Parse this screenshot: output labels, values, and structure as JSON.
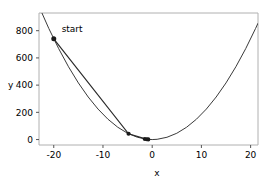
{
  "chart_data": {
    "type": "line",
    "title": "",
    "xlabel": "x",
    "ylabel": "y",
    "xlim": [
      -23.0,
      21.5
    ],
    "ylim": [
      -40,
      930
    ],
    "xticks": [
      -20,
      -10,
      0,
      10,
      20
    ],
    "xticklabels": [
      "-20",
      "-10",
      "0",
      "10",
      "20"
    ],
    "yticks": [
      0,
      200,
      400,
      600,
      800
    ],
    "yticklabels": [
      "0",
      "200",
      "400",
      "600",
      "800"
    ],
    "grid": false,
    "legend": null,
    "series": [
      {
        "name": "objective curve",
        "type": "line",
        "function": "y = 1.85 * x^2",
        "color": "#3a3a3a",
        "linewidth": 1.0,
        "x": [
          -23.0,
          -21.0,
          -19.0,
          -17.0,
          -15.0,
          -13.0,
          -11.0,
          -9.0,
          -7.0,
          -5.0,
          -3.0,
          -1.0,
          0.0,
          1.0,
          3.0,
          5.0,
          7.0,
          9.0,
          11.0,
          13.0,
          15.0,
          17.0,
          19.0,
          21.0,
          21.5
        ],
        "y": [
          978.6,
          815.9,
          667.9,
          534.7,
          416.3,
          312.7,
          223.9,
          149.9,
          90.7,
          46.3,
          16.7,
          1.9,
          0.0,
          1.9,
          16.7,
          46.3,
          90.7,
          149.9,
          223.9,
          312.7,
          416.3,
          534.7,
          667.9,
          815.9,
          855.2
        ]
      },
      {
        "name": "descent path",
        "type": "line",
        "color": "#2b2b2b",
        "linewidth": 1.2,
        "x": [
          -20.0,
          -4.8,
          -1.2,
          -0.9,
          -0.75
        ],
        "y": [
          740.0,
          42.6,
          2.7,
          1.5,
          1.0
        ]
      }
    ],
    "markers": [
      {
        "label": "start",
        "x": -20.0,
        "y": 740.0,
        "size": 5.0,
        "color": "#1a1a1a"
      },
      {
        "label": "",
        "x": -4.8,
        "y": 42.6,
        "size": 4.2,
        "color": "#1a1a1a"
      },
      {
        "label": "",
        "x": -1.5,
        "y": 4.2,
        "size": 4.2,
        "color": "#1a1a1a"
      },
      {
        "label": "",
        "x": -1.1,
        "y": 2.2,
        "size": 4.2,
        "color": "#1a1a1a"
      },
      {
        "label": "",
        "x": -0.8,
        "y": 1.2,
        "size": 4.2,
        "color": "#1a1a1a"
      }
    ],
    "annotations": [
      {
        "text": "start",
        "x": -18.4,
        "y": 790.0
      }
    ]
  },
  "axes": {
    "spine_color": "#b0b0b0",
    "tick_color": "#555555",
    "text_color": "#000000"
  }
}
